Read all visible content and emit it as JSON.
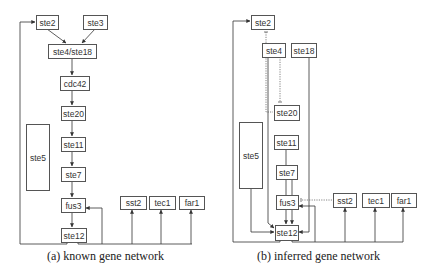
{
  "panels": [
    {
      "id": "known",
      "caption": "(a) known gene network",
      "nodes": [
        {
          "id": "ste2",
          "label": "ste2",
          "x": 36,
          "y": 15,
          "w": 22,
          "h": 14
        },
        {
          "id": "ste3",
          "label": "ste3",
          "x": 83,
          "y": 15,
          "w": 24,
          "h": 14
        },
        {
          "id": "ste4_ste18",
          "label": "ste4/ste18",
          "x": 48,
          "y": 44,
          "w": 48,
          "h": 14
        },
        {
          "id": "cdc42",
          "label": "cdc42",
          "x": 60,
          "y": 76,
          "w": 29,
          "h": 14
        },
        {
          "id": "ste20",
          "label": "ste20",
          "x": 61,
          "y": 106,
          "w": 24,
          "h": 14
        },
        {
          "id": "ste11",
          "label": "ste11",
          "x": 61,
          "y": 137,
          "w": 24,
          "h": 14
        },
        {
          "id": "ste7",
          "label": "ste7",
          "x": 61,
          "y": 167,
          "w": 24,
          "h": 14
        },
        {
          "id": "ste5",
          "label": "ste5",
          "x": 26,
          "y": 124,
          "w": 23,
          "h": 66
        },
        {
          "id": "fus3",
          "label": "fus3",
          "x": 61,
          "y": 198,
          "w": 24,
          "h": 14
        },
        {
          "id": "ste12",
          "label": "ste12",
          "x": 61,
          "y": 228,
          "w": 25,
          "h": 14
        },
        {
          "id": "sst2",
          "label": "sst2",
          "x": 120,
          "y": 196,
          "w": 26,
          "h": 13
        },
        {
          "id": "tec1",
          "label": "tec1",
          "x": 149,
          "y": 196,
          "w": 26,
          "h": 13
        },
        {
          "id": "far1",
          "label": "far1",
          "x": 179,
          "y": 196,
          "w": 25,
          "h": 13
        }
      ]
    },
    {
      "id": "inferred",
      "caption": "(b) inferred gene network",
      "nodes": [
        {
          "id": "ste2",
          "label": "ste2",
          "x": 251,
          "y": 15,
          "w": 23,
          "h": 14
        },
        {
          "id": "ste4",
          "label": "ste4",
          "x": 262,
          "y": 43,
          "w": 23,
          "h": 14
        },
        {
          "id": "ste18",
          "label": "ste18",
          "x": 291,
          "y": 43,
          "w": 25,
          "h": 14
        },
        {
          "id": "ste20",
          "label": "ste20",
          "x": 274,
          "y": 105,
          "w": 25,
          "h": 15
        },
        {
          "id": "ste5",
          "label": "ste5",
          "x": 239,
          "y": 122,
          "w": 23,
          "h": 66
        },
        {
          "id": "ste11",
          "label": "ste11",
          "x": 274,
          "y": 135,
          "w": 24,
          "h": 14
        },
        {
          "id": "ste7",
          "label": "ste7",
          "x": 276,
          "y": 165,
          "w": 21,
          "h": 14
        },
        {
          "id": "fus3",
          "label": "fus3",
          "x": 276,
          "y": 195,
          "w": 22,
          "h": 14
        },
        {
          "id": "ste12",
          "label": "ste12",
          "x": 275,
          "y": 225,
          "w": 23,
          "h": 15
        },
        {
          "id": "sst2",
          "label": "sst2",
          "x": 333,
          "y": 193,
          "w": 23,
          "h": 14
        },
        {
          "id": "tec1",
          "label": "tec1",
          "x": 362,
          "y": 193,
          "w": 27,
          "h": 14
        },
        {
          "id": "far1",
          "label": "far1",
          "x": 391,
          "y": 193,
          "w": 25,
          "h": 14
        }
      ]
    }
  ]
}
